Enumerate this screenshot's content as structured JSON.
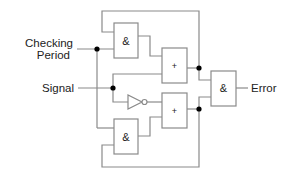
{
  "diagram": {
    "type": "logic-circuit",
    "inputs": {
      "checking_period_line1": "Checking",
      "checking_period_line2": "Period",
      "signal": "Signal"
    },
    "output": {
      "error": "Error"
    },
    "gates": {
      "and_top": "&",
      "or_top": "+",
      "or_bottom": "+",
      "and_bottom": "&",
      "and_final": "&"
    },
    "colors": {
      "wire": "#8a8a8a",
      "junction": "#000000",
      "text": "#222222"
    }
  }
}
